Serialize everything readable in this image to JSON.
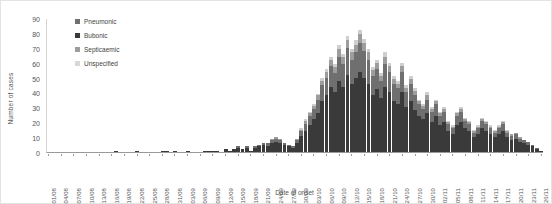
{
  "chart_data": {
    "type": "bar",
    "stacked": true,
    "title": "",
    "xlabel": "Date of onset",
    "ylabel": "Number of cases",
    "ylim": [
      0,
      90
    ],
    "ytick_step": 10,
    "yticks": [
      0,
      10,
      20,
      30,
      40,
      50,
      60,
      70,
      80,
      90
    ],
    "grid": false,
    "legend_position": "top-left",
    "legend": [
      "Pneumonic",
      "Bubonic",
      "Septicaemic",
      "Unspecified"
    ],
    "colors": {
      "pneumonic": "#6f6f6f",
      "bubonic": "#3a3a3a",
      "septicaemic": "#9d9d9d",
      "unspecified": "#cfcfcf"
    },
    "xtick_labels": [
      "01/08",
      "04/08",
      "07/08",
      "10/08",
      "13/08",
      "16/08",
      "19/08",
      "22/08",
      "25/08",
      "28/08",
      "31/08",
      "03/09",
      "06/09",
      "09/09",
      "12/09",
      "15/09",
      "18/09",
      "21/09",
      "24/09",
      "27/09",
      "30/09",
      "03/10",
      "06/10",
      "09/10",
      "12/10",
      "15/10",
      "18/10",
      "21/10",
      "24/10",
      "27/10",
      "30/10",
      "02/11",
      "05/11",
      "08/11",
      "11/11",
      "14/11",
      "17/11",
      "20/11",
      "23/11",
      "26/11"
    ],
    "xtick_every": 3,
    "categories": [
      "01/08",
      "02/08",
      "03/08",
      "04/08",
      "05/08",
      "06/08",
      "07/08",
      "08/08",
      "09/08",
      "10/08",
      "11/08",
      "12/08",
      "13/08",
      "14/08",
      "15/08",
      "16/08",
      "17/08",
      "18/08",
      "19/08",
      "20/08",
      "21/08",
      "22/08",
      "23/08",
      "24/08",
      "25/08",
      "26/08",
      "27/08",
      "28/08",
      "29/08",
      "30/08",
      "31/08",
      "01/09",
      "02/09",
      "03/09",
      "04/09",
      "05/09",
      "06/09",
      "07/09",
      "08/09",
      "09/09",
      "10/09",
      "11/09",
      "12/09",
      "13/09",
      "14/09",
      "15/09",
      "16/09",
      "17/09",
      "18/09",
      "19/09",
      "20/09",
      "21/09",
      "22/09",
      "23/09",
      "24/09",
      "25/09",
      "26/09",
      "27/09",
      "28/09",
      "29/09",
      "30/09",
      "01/10",
      "02/10",
      "03/10",
      "04/10",
      "05/10",
      "06/10",
      "07/10",
      "08/10",
      "09/10",
      "10/10",
      "11/10",
      "12/10",
      "13/10",
      "14/10",
      "15/10",
      "16/10",
      "17/10",
      "18/10",
      "19/10",
      "20/10",
      "21/10",
      "22/10",
      "23/10",
      "24/10",
      "25/10",
      "26/10",
      "27/10",
      "28/10",
      "29/10",
      "30/10",
      "31/10",
      "01/11",
      "02/11",
      "03/11",
      "04/11",
      "05/11",
      "06/11",
      "07/11",
      "08/11",
      "09/11",
      "10/11",
      "11/11",
      "12/11",
      "13/11",
      "14/11",
      "15/11",
      "16/11",
      "17/11",
      "18/11",
      "19/11",
      "20/11",
      "21/11",
      "22/11",
      "23/11",
      "24/11",
      "25/11",
      "26/11"
    ],
    "series": [
      {
        "name": "Bubonic",
        "key": "bubonic",
        "values": [
          0,
          0,
          0,
          0,
          0,
          0,
          0,
          0,
          0,
          0,
          0,
          0,
          0,
          0,
          0,
          0,
          1,
          0,
          0,
          0,
          0,
          1,
          0,
          0,
          0,
          0,
          0,
          1,
          1,
          0,
          1,
          0,
          0,
          1,
          0,
          0,
          0,
          1,
          1,
          1,
          1,
          0,
          2,
          1,
          2,
          3,
          2,
          3,
          1,
          3,
          4,
          5,
          4,
          6,
          7,
          6,
          5,
          4,
          3,
          6,
          11,
          14,
          18,
          22,
          26,
          34,
          38,
          44,
          40,
          48,
          44,
          52,
          46,
          50,
          54,
          50,
          46,
          38,
          42,
          36,
          44,
          40,
          34,
          32,
          40,
          30,
          34,
          28,
          24,
          22,
          26,
          20,
          24,
          18,
          20,
          14,
          12,
          18,
          20,
          16,
          14,
          10,
          12,
          16,
          14,
          12,
          10,
          12,
          14,
          10,
          8,
          9,
          7,
          6,
          5,
          4,
          2,
          1
        ]
      },
      {
        "name": "Pneumonic",
        "key": "pneumonic",
        "values": [
          0,
          0,
          0,
          0,
          0,
          0,
          0,
          0,
          0,
          0,
          0,
          0,
          0,
          0,
          0,
          0,
          0,
          0,
          0,
          0,
          0,
          0,
          0,
          0,
          0,
          0,
          0,
          0,
          0,
          0,
          0,
          0,
          0,
          0,
          0,
          0,
          0,
          0,
          0,
          0,
          0,
          0,
          0,
          0,
          0,
          1,
          0,
          1,
          0,
          1,
          1,
          1,
          2,
          2,
          2,
          2,
          1,
          1,
          1,
          2,
          3,
          5,
          6,
          7,
          9,
          11,
          12,
          14,
          13,
          16,
          15,
          18,
          16,
          17,
          19,
          18,
          16,
          13,
          14,
          12,
          15,
          14,
          12,
          11,
          14,
          10,
          12,
          10,
          8,
          7,
          9,
          7,
          8,
          6,
          7,
          5,
          4,
          6,
          7,
          5,
          5,
          3,
          4,
          5,
          5,
          4,
          3,
          4,
          5,
          3,
          3,
          3,
          2,
          2,
          2,
          1,
          1,
          0
        ]
      },
      {
        "name": "Septicaemic",
        "key": "septicaemic",
        "values": [
          0,
          0,
          0,
          0,
          0,
          0,
          0,
          0,
          0,
          0,
          0,
          0,
          0,
          0,
          0,
          0,
          0,
          0,
          0,
          0,
          0,
          0,
          0,
          0,
          0,
          0,
          0,
          0,
          0,
          0,
          0,
          0,
          0,
          0,
          0,
          0,
          0,
          0,
          0,
          0,
          0,
          0,
          0,
          0,
          0,
          0,
          0,
          0,
          0,
          0,
          0,
          0,
          0,
          1,
          1,
          1,
          0,
          0,
          0,
          1,
          1,
          2,
          2,
          2,
          3,
          3,
          4,
          4,
          4,
          5,
          5,
          5,
          5,
          5,
          6,
          5,
          5,
          4,
          4,
          3,
          5,
          4,
          3,
          3,
          4,
          3,
          3,
          3,
          2,
          2,
          3,
          2,
          2,
          2,
          2,
          1,
          1,
          2,
          2,
          1,
          1,
          1,
          1,
          1,
          1,
          1,
          1,
          1,
          1,
          1,
          1,
          1,
          1,
          0,
          0,
          0,
          0,
          0
        ]
      },
      {
        "name": "Unspecified",
        "key": "unspecified",
        "values": [
          0,
          0,
          0,
          0,
          0,
          0,
          0,
          0,
          0,
          0,
          0,
          0,
          0,
          0,
          0,
          0,
          0,
          0,
          0,
          0,
          0,
          0,
          0,
          0,
          0,
          0,
          0,
          0,
          0,
          0,
          0,
          0,
          0,
          0,
          0,
          0,
          0,
          0,
          0,
          0,
          0,
          0,
          0,
          0,
          0,
          0,
          0,
          0,
          0,
          0,
          0,
          0,
          0,
          0,
          0,
          0,
          0,
          0,
          0,
          0,
          1,
          1,
          1,
          1,
          1,
          2,
          2,
          2,
          2,
          3,
          2,
          3,
          2,
          3,
          3,
          3,
          2,
          2,
          2,
          2,
          3,
          2,
          2,
          2,
          2,
          2,
          2,
          2,
          1,
          1,
          2,
          1,
          1,
          1,
          1,
          1,
          1,
          1,
          1,
          1,
          1,
          1,
          1,
          1,
          1,
          1,
          1,
          1,
          1,
          1,
          0,
          0,
          0,
          0,
          0,
          0,
          0,
          0
        ]
      }
    ]
  }
}
